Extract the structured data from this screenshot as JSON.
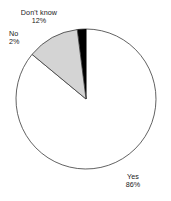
{
  "chart_data": {
    "type": "pie",
    "title": "",
    "categories": [
      "Yes",
      "Don't know",
      "No"
    ],
    "values": [
      86,
      12,
      2
    ],
    "value_unit": "%",
    "slice_colors": [
      "#ffffff",
      "#d4d4d4",
      "#000000"
    ],
    "outline_color": "#333333",
    "background": "#ffffff",
    "legend": "none",
    "labels_position": "outside",
    "start_angle_deg": 0,
    "direction": "clockwise",
    "slices": [
      {
        "label": "Yes",
        "pct_text": "86%",
        "value": 86,
        "color": "#ffffff"
      },
      {
        "label": "Don't know",
        "pct_text": "12%",
        "value": 12,
        "color": "#d4d4d4"
      },
      {
        "label": "No",
        "pct_text": "2%",
        "value": 2,
        "color": "#000000"
      }
    ]
  }
}
